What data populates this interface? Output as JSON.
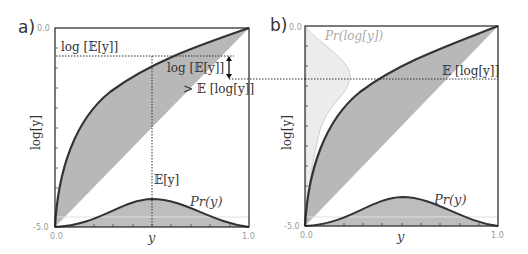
{
  "panels": [
    {
      "label": "a)",
      "ylabel": "log[y]",
      "xlabel": "y",
      "y_ticks": {
        "top": "0.0",
        "bottom": "-5.0"
      },
      "x_ticks": {
        "left": "0.0",
        "right": "1.0"
      },
      "annotations": {
        "log_E_y": "log [𝔼[y]]",
        "log_E_y_2": "log [𝔼[y]]",
        "gt_E_log_y": "> 𝔼 [log[y]]",
        "E_y": "𝔼[y]",
        "pr_y": "Pr(y)"
      }
    },
    {
      "label": "b)",
      "ylabel": "log[y]",
      "xlabel": "y",
      "y_ticks": {
        "top": "0.0",
        "bottom": "-5.0"
      },
      "x_ticks": {
        "left": "0.0",
        "right": "1.0"
      },
      "annotations": {
        "pr_log_y": "Pr(log[y])",
        "E_log_y": "𝔼 [log[y]]",
        "pr_y": "Pr(y)"
      }
    }
  ],
  "colors": {
    "curve": "#333333",
    "fill": "#b8b8b8",
    "light_fill": "#ececec",
    "light_curve": "#cccccc",
    "frame": "#222222"
  }
}
